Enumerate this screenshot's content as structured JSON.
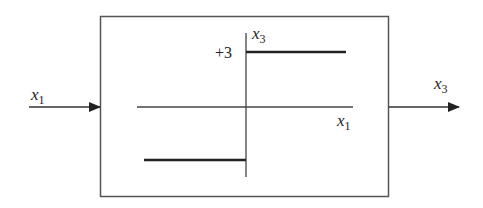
{
  "diagram": {
    "type": "block-diagram",
    "colors": {
      "line": "#333333",
      "text": "#222222",
      "background": "#ffffff"
    },
    "input": {
      "var": "x",
      "sub": "1"
    },
    "output": {
      "var": "x",
      "sub": "3"
    },
    "block": {
      "axes": {
        "horizontal": {
          "var": "x",
          "sub": "1"
        },
        "vertical": {
          "var": "x",
          "sub": "3"
        }
      },
      "level_label": "+3",
      "characteristic": [
        {
          "segment": "upper",
          "x_range": "x1 > 0",
          "value": "+3"
        },
        {
          "segment": "lower",
          "x_range": "x1 < 0",
          "value": "-3"
        }
      ]
    }
  }
}
